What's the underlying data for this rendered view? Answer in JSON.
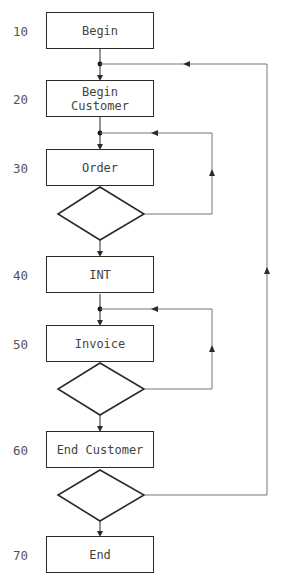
{
  "steps": [
    {
      "num": "10",
      "label": "Begin"
    },
    {
      "num": "20",
      "label": "Begin Customer"
    },
    {
      "num": "30",
      "label": "Order"
    },
    {
      "num": "40",
      "label": "INT"
    },
    {
      "num": "50",
      "label": "Invoice"
    },
    {
      "num": "60",
      "label": "End Customer"
    },
    {
      "num": "70",
      "label": "End"
    }
  ],
  "decisions": [
    {
      "name": "order-loop-decision",
      "loops_to": "Order"
    },
    {
      "name": "invoice-loop-decision",
      "loops_to": "Invoice"
    },
    {
      "name": "customer-loop-decision",
      "loops_to": "Begin Customer"
    }
  ],
  "colors": {
    "stroke": "#2a2a2a",
    "loop_line": "#777777",
    "background": "#ffffff"
  }
}
